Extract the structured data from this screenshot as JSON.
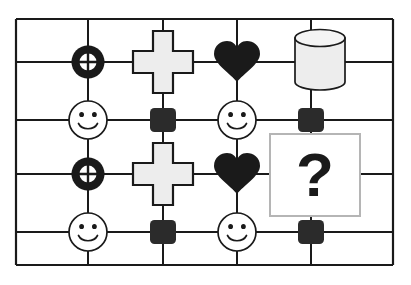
{
  "diagram": {
    "type": "node-link-grid",
    "background_color": "#ffffff",
    "line_color": "#1a1a1a",
    "fill_light": "#ededed",
    "fill_dark": "#2b2b2b",
    "frame": {
      "x": 16,
      "y": 19,
      "width": 377,
      "height": 246,
      "stroke_width": 2.2
    },
    "grid": {
      "columns_x": [
        16,
        88,
        163,
        237,
        311,
        393
      ],
      "rows_y": [
        19,
        62,
        120,
        174,
        232,
        265
      ],
      "stroke_width": 2
    },
    "nodes": [
      {
        "id": "n-crosshair-1",
        "icon": "crosshair-ring-icon",
        "label": "crosshair ring",
        "x": 88,
        "y": 62,
        "fill": "#1a1a1a"
      },
      {
        "id": "n-cross-1",
        "icon": "plus-cross-icon",
        "label": "plus cross",
        "x": 163,
        "y": 62,
        "fill": "#ededed"
      },
      {
        "id": "n-heart-1",
        "icon": "heart-icon",
        "label": "heart",
        "x": 237,
        "y": 62,
        "fill": "#1a1a1a"
      },
      {
        "id": "n-cylinder-1",
        "icon": "cylinder-icon",
        "label": "cylinder",
        "x": 320,
        "y": 62,
        "fill": "#ededed"
      },
      {
        "id": "n-smiley-1",
        "icon": "smiley-face-icon",
        "label": "smiley face",
        "x": 88,
        "y": 120,
        "fill": "#ffffff"
      },
      {
        "id": "n-square-1",
        "icon": "rounded-square-icon",
        "label": "dark square",
        "x": 163,
        "y": 120,
        "fill": "#2b2b2b"
      },
      {
        "id": "n-smiley-2",
        "icon": "smiley-face-icon",
        "label": "smiley face",
        "x": 237,
        "y": 120,
        "fill": "#ffffff"
      },
      {
        "id": "n-square-2",
        "icon": "rounded-square-icon",
        "label": "dark square",
        "x": 311,
        "y": 120,
        "fill": "#2b2b2b"
      },
      {
        "id": "n-crosshair-2",
        "icon": "crosshair-ring-icon",
        "label": "crosshair ring",
        "x": 88,
        "y": 174,
        "fill": "#1a1a1a"
      },
      {
        "id": "n-cross-2",
        "icon": "plus-cross-icon",
        "label": "plus cross",
        "x": 163,
        "y": 174,
        "fill": "#ededed"
      },
      {
        "id": "n-heart-2",
        "icon": "heart-icon",
        "label": "heart",
        "x": 237,
        "y": 174,
        "fill": "#1a1a1a"
      },
      {
        "id": "n-question-box",
        "icon": "question-box-icon",
        "label": "question box",
        "x": 315,
        "y": 175,
        "fill": "#ffffff"
      },
      {
        "id": "n-smiley-3",
        "icon": "smiley-face-icon",
        "label": "smiley face",
        "x": 88,
        "y": 232,
        "fill": "#ffffff"
      },
      {
        "id": "n-square-3",
        "icon": "rounded-square-icon",
        "label": "dark square",
        "x": 163,
        "y": 232,
        "fill": "#2b2b2b"
      },
      {
        "id": "n-smiley-4",
        "icon": "smiley-face-icon",
        "label": "smiley face",
        "x": 237,
        "y": 232,
        "fill": "#ffffff"
      },
      {
        "id": "n-square-4",
        "icon": "rounded-square-icon",
        "label": "dark square",
        "x": 311,
        "y": 232,
        "fill": "#2b2b2b"
      }
    ],
    "question_mark": {
      "symbol": "?",
      "box": {
        "x": 270,
        "y": 134,
        "width": 90,
        "height": 82,
        "stroke": "#b5b5b5",
        "fill": "#ffffff"
      }
    }
  }
}
